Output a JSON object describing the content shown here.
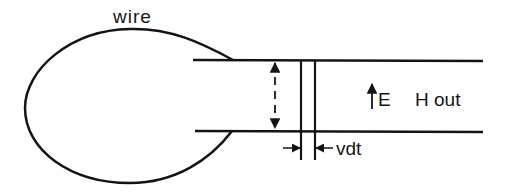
{
  "diagram": {
    "labels": {
      "wire": "wire",
      "field_e": "E",
      "field_h": "H out",
      "displacement": "vdt"
    },
    "colors": {
      "ink": "#141414",
      "background": "#ffffff"
    }
  }
}
